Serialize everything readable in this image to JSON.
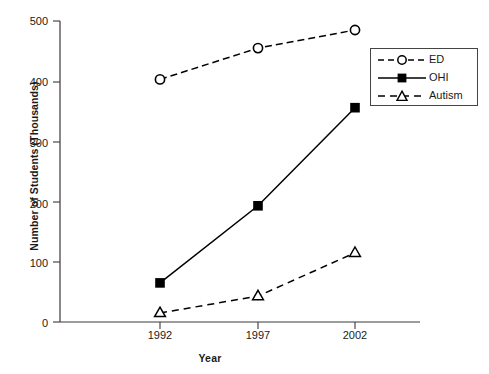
{
  "chart_data": {
    "type": "line",
    "title": "",
    "xlabel": "Year",
    "ylabel": "Number of Students (Thousands)",
    "categories": [
      "1992",
      "1997",
      "2002"
    ],
    "x": [
      1992,
      1997,
      2002
    ],
    "xlim": [
      1990,
      2004
    ],
    "ylim": [
      0,
      500
    ],
    "yticks": [
      0,
      100,
      200,
      300,
      400,
      500
    ],
    "ytick_labels": [
      "0",
      "100",
      "200",
      "300",
      "400",
      "500"
    ],
    "xtick_labels": [
      "1992",
      "1997",
      "2002"
    ],
    "grid": false,
    "legend_position": "upper right",
    "series": [
      {
        "name": "ED",
        "values": [
          403,
          455,
          485
        ],
        "marker": "open-circle",
        "linestyle": "dashed",
        "color": "#000000"
      },
      {
        "name": "OHI",
        "values": [
          65,
          193,
          356
        ],
        "marker": "filled-square",
        "linestyle": "solid",
        "color": "#000000"
      },
      {
        "name": "Autism",
        "values": [
          15,
          43,
          115
        ],
        "marker": "open-triangle",
        "linestyle": "dashed",
        "color": "#000000"
      }
    ]
  },
  "axes": {
    "y_title": "Number of Students (Thousands)",
    "x_title": "Year",
    "y_labels": {
      "t500": "500",
      "t400": "400",
      "t300": "300",
      "t200": "200",
      "t100": "100",
      "t0": "0"
    },
    "x_labels": {
      "x1992": "1992",
      "x1997": "1997",
      "x2002": "2002"
    }
  },
  "legend": {
    "entries": [
      {
        "label": "ED"
      },
      {
        "label": "OHI"
      },
      {
        "label": "Autism"
      }
    ]
  },
  "colors": {
    "ink": "#000000",
    "axis": "#3a3a3a",
    "background": "#ffffff"
  }
}
